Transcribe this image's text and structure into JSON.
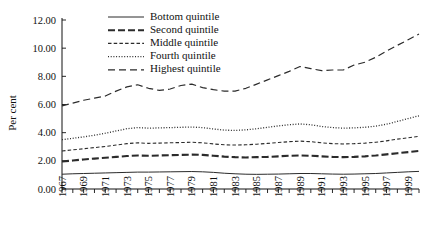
{
  "chart_data": {
    "type": "line",
    "title": "",
    "xlabel": "",
    "ylabel": "Per cent",
    "ylim": [
      0,
      12
    ],
    "xlim": [
      1967,
      2000
    ],
    "yticks": [
      "0.00",
      "2.00",
      "4.00",
      "6.00",
      "8.00",
      "10.00",
      "12.00"
    ],
    "ytick_values": [
      0,
      2,
      4,
      6,
      8,
      10,
      12
    ],
    "xticks": [
      "1967",
      "1969",
      "1971",
      "1973",
      "1975",
      "1977",
      "1979",
      "1981",
      "1983",
      "1985",
      "1987",
      "1989",
      "1991",
      "1993",
      "1995",
      "1997",
      "1999"
    ],
    "xtick_values": [
      1967,
      1969,
      1971,
      1973,
      1975,
      1977,
      1979,
      1981,
      1983,
      1985,
      1987,
      1989,
      1991,
      1993,
      1995,
      1997,
      1999
    ],
    "grid": false,
    "legend_position": "top-center",
    "x": [
      1967,
      1968,
      1969,
      1970,
      1971,
      1972,
      1973,
      1974,
      1975,
      1976,
      1977,
      1978,
      1979,
      1980,
      1981,
      1982,
      1983,
      1984,
      1985,
      1986,
      1987,
      1988,
      1989,
      1990,
      1991,
      1992,
      1993,
      1994,
      1995,
      1996,
      1997,
      1998,
      1999,
      2000
    ],
    "series": [
      {
        "name": "Bottom quintile",
        "style": "solid-thin",
        "color": "#2b2b2b",
        "values": [
          1.05,
          1.08,
          1.1,
          1.12,
          1.14,
          1.16,
          1.18,
          1.2,
          1.2,
          1.21,
          1.22,
          1.23,
          1.24,
          1.22,
          1.18,
          1.12,
          1.08,
          1.05,
          1.04,
          1.05,
          1.06,
          1.08,
          1.1,
          1.1,
          1.08,
          1.06,
          1.05,
          1.06,
          1.08,
          1.1,
          1.14,
          1.18,
          1.22,
          1.25
        ]
      },
      {
        "name": "Second quintile",
        "style": "dash-thick",
        "color": "#2b2b2b",
        "values": [
          1.95,
          2.02,
          2.1,
          2.16,
          2.22,
          2.28,
          2.34,
          2.38,
          2.36,
          2.38,
          2.4,
          2.42,
          2.44,
          2.42,
          2.36,
          2.3,
          2.26,
          2.24,
          2.26,
          2.28,
          2.32,
          2.36,
          2.38,
          2.36,
          2.32,
          2.28,
          2.26,
          2.28,
          2.32,
          2.38,
          2.46,
          2.54,
          2.62,
          2.7
        ]
      },
      {
        "name": "Middle quintile",
        "style": "dash-short",
        "color": "#2b2b2b",
        "values": [
          2.7,
          2.78,
          2.86,
          2.94,
          3.02,
          3.12,
          3.22,
          3.28,
          3.24,
          3.26,
          3.28,
          3.3,
          3.32,
          3.28,
          3.2,
          3.14,
          3.12,
          3.14,
          3.18,
          3.24,
          3.3,
          3.36,
          3.4,
          3.36,
          3.28,
          3.22,
          3.2,
          3.22,
          3.26,
          3.32,
          3.42,
          3.54,
          3.64,
          3.74
        ]
      },
      {
        "name": "Fourth quintile",
        "style": "dotted",
        "color": "#2b2b2b",
        "values": [
          3.5,
          3.6,
          3.7,
          3.82,
          3.96,
          4.12,
          4.28,
          4.36,
          4.32,
          4.34,
          4.36,
          4.38,
          4.4,
          4.36,
          4.26,
          4.18,
          4.16,
          4.2,
          4.28,
          4.38,
          4.48,
          4.56,
          4.62,
          4.56,
          4.44,
          4.36,
          4.32,
          4.34,
          4.38,
          4.46,
          4.6,
          4.8,
          5.0,
          5.2
        ]
      },
      {
        "name": "Highest quintile",
        "style": "dash-long",
        "color": "#2b2b2b",
        "values": [
          5.9,
          6.1,
          6.3,
          6.45,
          6.6,
          6.95,
          7.25,
          7.4,
          7.15,
          7.0,
          7.1,
          7.35,
          7.45,
          7.2,
          7.05,
          6.95,
          6.95,
          7.15,
          7.45,
          7.75,
          8.05,
          8.35,
          8.7,
          8.55,
          8.4,
          8.45,
          8.45,
          8.8,
          9.0,
          9.35,
          9.8,
          10.2,
          10.6,
          11.0
        ]
      }
    ],
    "legend": [
      {
        "label": "Bottom quintile",
        "style": "solid-thin"
      },
      {
        "label": "Second quintile",
        "style": "dash-thick"
      },
      {
        "label": "Middle quintile",
        "style": "dash-short"
      },
      {
        "label": "Fourth quintile",
        "style": "dotted"
      },
      {
        "label": "Highest quintile",
        "style": "dash-long"
      }
    ]
  }
}
